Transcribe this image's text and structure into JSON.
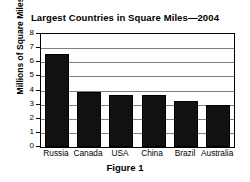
{
  "chart_data": {
    "type": "bar",
    "title": "Largest Countries in Square Miles—2004",
    "xlabel": "",
    "ylabel": "Millions of Square Miles",
    "categories": [
      "Russia",
      "Canada",
      "USA",
      "China",
      "Brazil",
      "Australia"
    ],
    "values": [
      6.6,
      3.9,
      3.7,
      3.7,
      3.25,
      3.0
    ],
    "ylim": [
      0,
      8
    ],
    "ytick_labels": [
      "0",
      "1",
      "2",
      "3",
      "4",
      "5",
      "6",
      "7",
      "8"
    ],
    "ytick_values": [
      0,
      1,
      2,
      3,
      4,
      5,
      6,
      7,
      8
    ],
    "grid": true,
    "legend": false,
    "bar_color": "#111111",
    "caption": "Figure 1"
  }
}
